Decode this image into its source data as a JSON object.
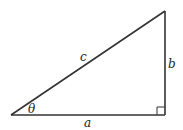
{
  "diagram": {
    "type": "right-triangle",
    "stroke_color": "#333333",
    "labels": {
      "hypotenuse": "c",
      "vertical_side": "b",
      "base": "a",
      "angle": "θ"
    },
    "vertices": {
      "angle_vertex": [
        11,
        115
      ],
      "top_vertex": [
        165,
        11
      ],
      "right_angle_vertex": [
        165,
        115
      ]
    },
    "right_angle_marker_size": 8
  }
}
